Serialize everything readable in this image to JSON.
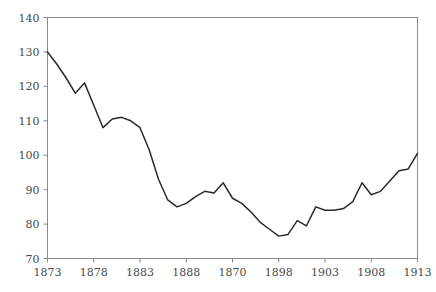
{
  "chart_data": {
    "type": "line",
    "title": "",
    "subtitle": "",
    "xlabel": "",
    "ylabel": "",
    "xlim": [
      1873,
      1913
    ],
    "ylim": [
      70,
      140
    ],
    "grid": false,
    "legend": null,
    "line_color": "#2b2b2b",
    "axis_color": "#8a8a8a",
    "label_color": "#4a4a4a",
    "background_color": "#ffffff",
    "yticks": [
      70,
      80,
      90,
      100,
      110,
      120,
      130,
      140
    ],
    "ytick_labels": [
      "70",
      "80",
      "90",
      "100",
      "110",
      "120",
      "130",
      "140"
    ],
    "xticks": [
      1873,
      1878,
      1883,
      1888,
      1893,
      1898,
      1903,
      1908,
      1913
    ],
    "xtick_labels": [
      "1873",
      "1878",
      "1883",
      "1888",
      "1870",
      "1898",
      "1903",
      "1908",
      "1913"
    ],
    "x": [
      1873,
      1874,
      1875,
      1876,
      1877,
      1878,
      1879,
      1880,
      1881,
      1882,
      1883,
      1884,
      1885,
      1886,
      1887,
      1888,
      1889,
      1890,
      1891,
      1892,
      1893,
      1894,
      1895,
      1896,
      1897,
      1898,
      1899,
      1900,
      1901,
      1902,
      1903,
      1904,
      1905,
      1906,
      1907,
      1908,
      1909,
      1910,
      1911,
      1912,
      1913
    ],
    "values": [
      130,
      126.5,
      122.5,
      118,
      121,
      114.5,
      108,
      110.5,
      111,
      110,
      108,
      101.5,
      93,
      87,
      85,
      86,
      88,
      89.5,
      89,
      92,
      87.5,
      86,
      83.5,
      80.5,
      78.5,
      76.5,
      77,
      81,
      79.5,
      85,
      84,
      84,
      84.5,
      86.5,
      92,
      88.5,
      89.5,
      92.5,
      95.5,
      96,
      100.5
    ],
    "series": [
      {
        "name": "index",
        "values": [
          130,
          126.5,
          122.5,
          118,
          121,
          114.5,
          108,
          110.5,
          111,
          110,
          108,
          101.5,
          93,
          87,
          85,
          86,
          88,
          89.5,
          89,
          92,
          87.5,
          86,
          83.5,
          80.5,
          78.5,
          76.5,
          77,
          81,
          79.5,
          85,
          84,
          84,
          84.5,
          86.5,
          92,
          88.5,
          89.5,
          92.5,
          95.5,
          96,
          100.5
        ]
      }
    ]
  }
}
